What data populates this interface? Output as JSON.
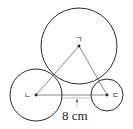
{
  "diagram": {
    "type": "three mutually tangent circles with triangle connecting centers",
    "points": {
      "top": {
        "label": "ㄱ",
        "x": 79,
        "y": 46
      },
      "left": {
        "label": "ㄴ",
        "x": 36,
        "y": 95
      },
      "right": {
        "label": "ㄷ",
        "x": 107,
        "y": 95
      }
    },
    "circles": [
      {
        "name": "big-circle",
        "center": "ㄱ",
        "cx": 79,
        "cy": 46,
        "r": 38
      },
      {
        "name": "left-circle",
        "center": "ㄴ",
        "cx": 36,
        "cy": 95,
        "r": 26
      },
      {
        "name": "right-circle",
        "center": "ㄷ",
        "cx": 107,
        "cy": 95,
        "r": 16
      }
    ],
    "measurement": {
      "label": "8 cm",
      "segment": "gap between left and right circles along line ㄴㄷ"
    }
  }
}
